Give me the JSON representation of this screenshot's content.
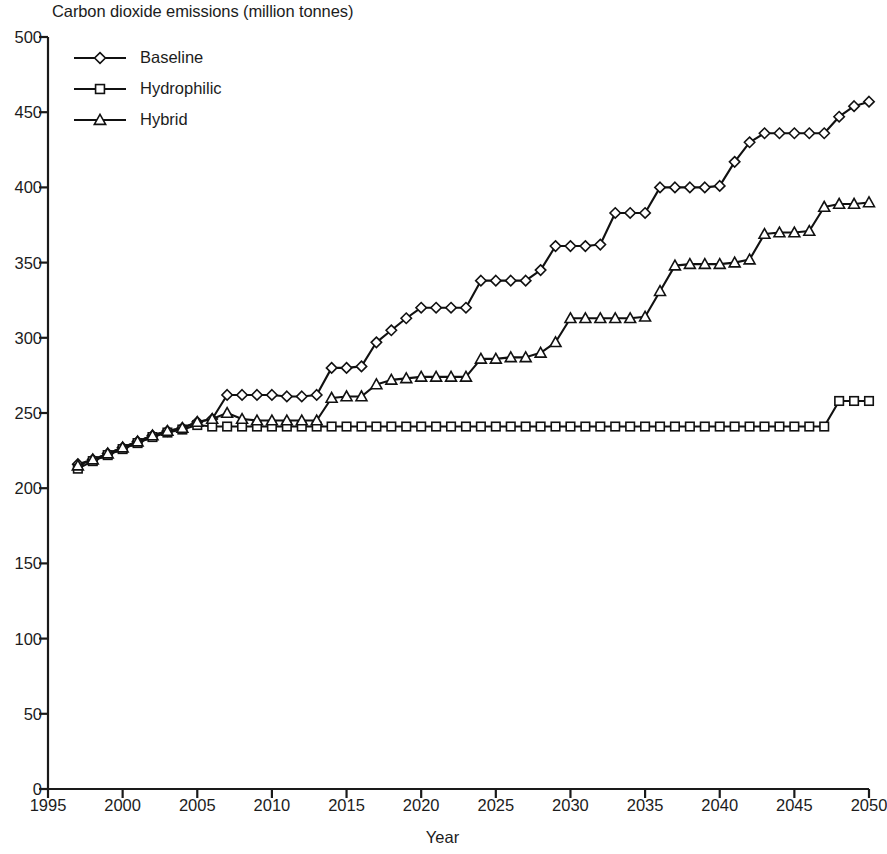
{
  "chart_data": {
    "type": "line",
    "title": "Carbon dioxide emissions (million tonnes)",
    "xlabel": "Year",
    "ylabel": "",
    "xlim": [
      1995,
      2050
    ],
    "ylim": [
      0,
      500
    ],
    "xticks": [
      1995,
      2000,
      2005,
      2010,
      2015,
      2020,
      2025,
      2030,
      2035,
      2040,
      2045,
      2050
    ],
    "yticks": [
      0,
      50,
      100,
      150,
      200,
      250,
      300,
      350,
      400,
      450,
      500
    ],
    "grid": false,
    "legend_position": "upper left",
    "x": [
      1997,
      1998,
      1999,
      2000,
      2001,
      2002,
      2003,
      2004,
      2005,
      2006,
      2007,
      2008,
      2009,
      2010,
      2011,
      2012,
      2013,
      2014,
      2015,
      2016,
      2017,
      2018,
      2019,
      2020,
      2021,
      2022,
      2023,
      2024,
      2025,
      2026,
      2027,
      2028,
      2029,
      2030,
      2031,
      2032,
      2033,
      2034,
      2035,
      2036,
      2037,
      2038,
      2039,
      2040,
      2041,
      2042,
      2043,
      2044,
      2045,
      2046,
      2047,
      2048,
      2049,
      2050
    ],
    "series": [
      {
        "name": "Baseline",
        "marker": "diamond",
        "values": [
          216,
          219,
          223,
          227,
          231,
          235,
          238,
          240,
          244,
          246,
          262,
          262,
          262,
          262,
          261,
          261,
          262,
          280,
          280,
          281,
          297,
          305,
          313,
          320,
          320,
          320,
          320,
          338,
          338,
          338,
          338,
          345,
          361,
          361,
          361,
          362,
          383,
          383,
          383,
          400,
          400,
          400,
          400,
          401,
          417,
          430,
          436,
          436,
          436,
          436,
          436,
          447,
          454,
          457
        ]
      },
      {
        "name": "Hydrophilic",
        "marker": "square",
        "values": [
          213,
          218,
          222,
          226,
          230,
          234,
          237,
          239,
          242,
          241,
          241,
          241,
          241,
          241,
          241,
          241,
          241,
          241,
          241,
          241,
          241,
          241,
          241,
          241,
          241,
          241,
          241,
          241,
          241,
          241,
          241,
          241,
          241,
          241,
          241,
          241,
          241,
          241,
          241,
          241,
          241,
          241,
          241,
          241,
          241,
          241,
          241,
          241,
          241,
          241,
          241,
          258,
          258,
          258
        ]
      },
      {
        "name": "Hybrid",
        "marker": "triangle",
        "values": [
          215,
          219,
          223,
          227,
          231,
          235,
          238,
          240,
          244,
          246,
          250,
          246,
          245,
          245,
          245,
          245,
          245,
          260,
          261,
          261,
          269,
          272,
          273,
          274,
          274,
          274,
          274,
          286,
          286,
          287,
          287,
          290,
          297,
          313,
          313,
          313,
          313,
          313,
          314,
          331,
          348,
          349,
          349,
          349,
          350,
          352,
          369,
          370,
          370,
          371,
          387,
          389,
          389,
          390
        ]
      }
    ]
  },
  "colors": {
    "line": "#111111",
    "marker_fill": "#ffffff",
    "axis": "#1a1a1a",
    "background": "#ffffff"
  },
  "legend": {
    "entries": [
      {
        "label": "Baseline",
        "marker": "diamond"
      },
      {
        "label": "Hydrophilic",
        "marker": "square"
      },
      {
        "label": "Hybrid",
        "marker": "triangle"
      }
    ]
  }
}
